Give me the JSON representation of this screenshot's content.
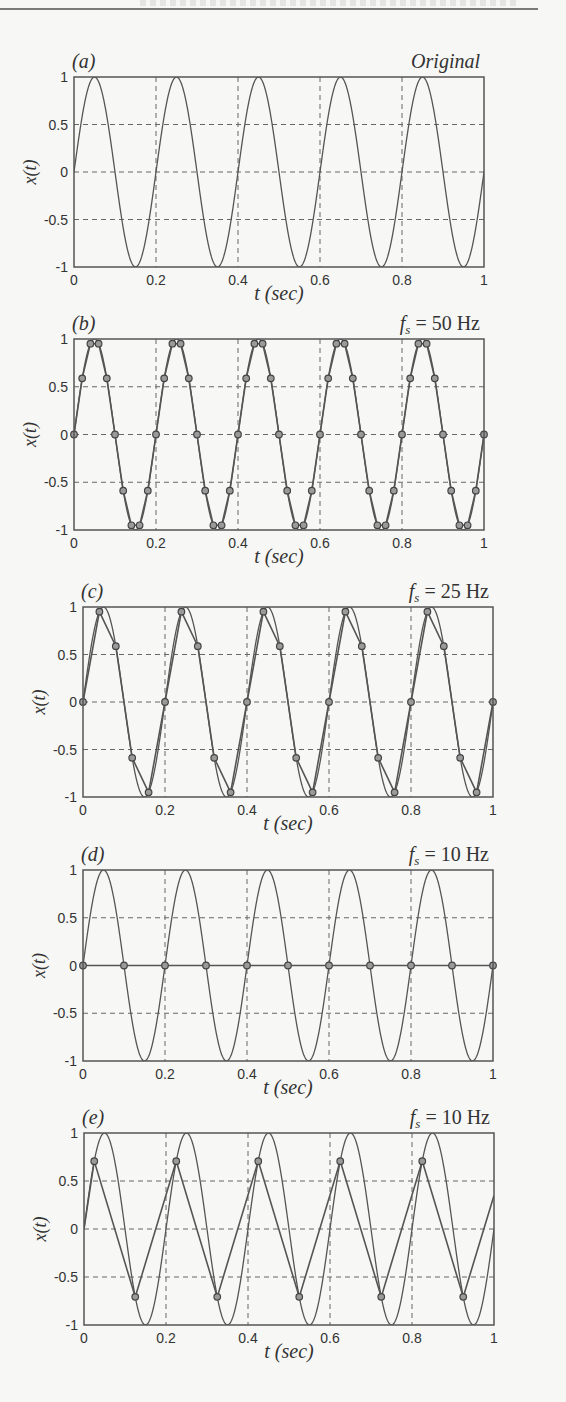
{
  "page": {
    "header_rule": true
  },
  "chart_data": [
    {
      "id": "a",
      "type": "line",
      "panel_label": "(a)",
      "title": "Original",
      "title_style": "italic",
      "xlabel": "t (sec)",
      "ylabel": "x(t)",
      "xlim": [
        0,
        1
      ],
      "ylim": [
        -1,
        1
      ],
      "xticks": [
        0,
        0.2,
        0.4,
        0.6,
        0.8,
        1
      ],
      "xtick_labels": [
        "0",
        "0.2",
        "0.4",
        "0.6",
        "0.8",
        "1"
      ],
      "yticks": [
        1,
        0.5,
        0,
        -0.5,
        -1
      ],
      "ytick_labels": [
        "1",
        "0.5",
        "0",
        "-0.5",
        "-1"
      ],
      "grid": "dashed",
      "box": {
        "x": 74,
        "y": 77,
        "w": 410,
        "h": 190
      },
      "series": [
        {
          "name": "x(t) = sin(2π·5t)",
          "kind": "continuous",
          "frequency_hz": 5,
          "phase_offset_s": 0
        }
      ]
    },
    {
      "id": "b",
      "type": "line",
      "panel_label": "(b)",
      "title": "f_s = 50 Hz",
      "title_sub": "s",
      "title_value": "= 50 Hz",
      "xlabel": "t (sec)",
      "ylabel": "x(t)",
      "xlim": [
        0,
        1
      ],
      "ylim": [
        -1,
        1
      ],
      "xticks": [
        0,
        0.2,
        0.4,
        0.6,
        0.8,
        1
      ],
      "xtick_labels": [
        "0",
        "0.2",
        "0.4",
        "0.6",
        "0.8",
        "1"
      ],
      "yticks": [
        1,
        0.5,
        0,
        -0.5,
        -1
      ],
      "ytick_labels": [
        "1",
        "0.5",
        "0",
        "-0.5",
        "-1"
      ],
      "grid": "dashed",
      "box": {
        "x": 74,
        "y": 339,
        "w": 410,
        "h": 191
      },
      "series": [
        {
          "name": "x(t)",
          "kind": "continuous",
          "frequency_hz": 5,
          "phase_offset_s": 0
        },
        {
          "name": "samples",
          "kind": "sampled",
          "sample_rate_hz": 50,
          "t0": 0,
          "t": [
            0,
            0.02,
            0.04,
            0.06,
            0.08,
            0.1,
            0.12,
            0.14,
            0.16,
            0.18,
            0.2,
            0.22,
            0.24,
            0.26,
            0.28,
            0.3,
            0.32,
            0.34,
            0.36,
            0.38,
            0.4,
            0.42,
            0.44,
            0.46,
            0.48,
            0.5,
            0.52,
            0.54,
            0.56,
            0.58,
            0.6,
            0.62,
            0.64,
            0.66,
            0.68,
            0.7,
            0.72,
            0.74,
            0.76,
            0.78,
            0.8,
            0.82,
            0.84,
            0.86,
            0.88,
            0.9,
            0.92,
            0.94,
            0.96,
            0.98,
            1.0
          ],
          "values": [
            0,
            0.588,
            0.951,
            0.951,
            0.588,
            0,
            -0.588,
            -0.951,
            -0.951,
            -0.588,
            0,
            0.588,
            0.951,
            0.951,
            0.588,
            0,
            -0.588,
            -0.951,
            -0.951,
            -0.588,
            0,
            0.588,
            0.951,
            0.951,
            0.588,
            0,
            -0.588,
            -0.951,
            -0.951,
            -0.588,
            0,
            0.588,
            0.951,
            0.951,
            0.588,
            0,
            -0.588,
            -0.951,
            -0.951,
            -0.588,
            0,
            0.588,
            0.951,
            0.951,
            0.588,
            0,
            -0.588,
            -0.951,
            -0.951,
            -0.588,
            0
          ]
        }
      ]
    },
    {
      "id": "c",
      "type": "line",
      "panel_label": "(c)",
      "title": "f_s = 25 Hz",
      "title_sub": "s",
      "title_value": "= 25 Hz",
      "xlabel": "t (sec)",
      "ylabel": "x(t)",
      "xlim": [
        0,
        1
      ],
      "ylim": [
        -1,
        1
      ],
      "xticks": [
        0,
        0.2,
        0.4,
        0.6,
        0.8,
        1
      ],
      "xtick_labels": [
        "0",
        "0.2",
        "0.4",
        "0.6",
        "0.8",
        "1"
      ],
      "yticks": [
        1,
        0.5,
        0,
        -0.5,
        -1
      ],
      "ytick_labels": [
        "1",
        "0.5",
        "0",
        "-0.5",
        "-1"
      ],
      "grid": "dashed",
      "box": {
        "x": 83,
        "y": 607,
        "w": 410,
        "h": 190
      },
      "series": [
        {
          "name": "x(t)",
          "kind": "continuous",
          "frequency_hz": 5,
          "phase_offset_s": 0
        },
        {
          "name": "samples",
          "kind": "sampled",
          "sample_rate_hz": 25,
          "t0": 0,
          "t": [
            0,
            0.04,
            0.08,
            0.12,
            0.16,
            0.2,
            0.24,
            0.28,
            0.32,
            0.36,
            0.4,
            0.44,
            0.48,
            0.52,
            0.56,
            0.6,
            0.64,
            0.68,
            0.72,
            0.76,
            0.8,
            0.84,
            0.88,
            0.92,
            0.96,
            1.0
          ],
          "values": [
            0,
            0.951,
            0.588,
            -0.588,
            -0.951,
            0,
            0.951,
            0.588,
            -0.588,
            -0.951,
            0,
            0.951,
            0.588,
            -0.588,
            -0.951,
            0,
            0.951,
            0.588,
            -0.588,
            -0.951,
            0,
            0.951,
            0.588,
            -0.588,
            -0.951,
            0
          ]
        }
      ]
    },
    {
      "id": "d",
      "type": "line",
      "panel_label": "(d)",
      "title": "f_s = 10 Hz",
      "title_sub": "s",
      "title_value": "= 10 Hz",
      "xlabel": "t (sec)",
      "ylabel": "x(t)",
      "xlim": [
        0,
        1
      ],
      "ylim": [
        -1,
        1
      ],
      "xticks": [
        0,
        0.2,
        0.4,
        0.6,
        0.8,
        1
      ],
      "xtick_labels": [
        "0",
        "0.2",
        "0.4",
        "0.6",
        "0.8",
        "1"
      ],
      "yticks": [
        1,
        0.5,
        0,
        -0.5,
        -1
      ],
      "ytick_labels": [
        "1",
        "0.5",
        "0",
        "-0.5",
        "-1"
      ],
      "grid": "dashed",
      "box": {
        "x": 83,
        "y": 870,
        "w": 410,
        "h": 191
      },
      "series": [
        {
          "name": "x(t)",
          "kind": "continuous",
          "frequency_hz": 5,
          "phase_offset_s": 0
        },
        {
          "name": "samples",
          "kind": "sampled",
          "sample_rate_hz": 10,
          "t0": 0,
          "t": [
            0,
            0.1,
            0.2,
            0.3,
            0.4,
            0.5,
            0.6,
            0.7,
            0.8,
            0.9,
            1.0
          ],
          "values": [
            0,
            0,
            0,
            0,
            0,
            0,
            0,
            0,
            0,
            0,
            0
          ]
        }
      ]
    },
    {
      "id": "e",
      "type": "line",
      "panel_label": "(e)",
      "title": "f_s = 10 Hz",
      "title_sub": "s",
      "title_value": "= 10 Hz",
      "xlabel": "t (sec)",
      "ylabel": "x(t)",
      "xlim": [
        0,
        1
      ],
      "ylim": [
        -1,
        1
      ],
      "xticks": [
        0,
        0.2,
        0.4,
        0.6,
        0.8,
        1
      ],
      "xtick_labels": [
        "0",
        "0.2",
        "0.4",
        "0.6",
        "0.8",
        "1"
      ],
      "yticks": [
        1,
        0.5,
        0,
        -0.5,
        -1
      ],
      "ytick_labels": [
        "1",
        "0.5",
        "0",
        "-0.5",
        "-1"
      ],
      "grid": "dashed",
      "box": {
        "x": 84,
        "y": 1133,
        "w": 410,
        "h": 192
      },
      "series": [
        {
          "name": "x(t)",
          "kind": "continuous",
          "frequency_hz": 5,
          "phase_offset_s": 0
        },
        {
          "name": "samples",
          "kind": "sampled",
          "sample_rate_hz": 10,
          "t0": 0.025,
          "line_start": [
            0,
            0
          ],
          "line_end": [
            1,
            0.35
          ],
          "t": [
            0.025,
            0.125,
            0.225,
            0.325,
            0.425,
            0.525,
            0.625,
            0.725,
            0.825,
            0.925
          ],
          "values": [
            0.707,
            -0.707,
            0.707,
            -0.707,
            0.707,
            -0.707,
            0.707,
            -0.707,
            0.707,
            -0.707
          ]
        }
      ]
    }
  ]
}
